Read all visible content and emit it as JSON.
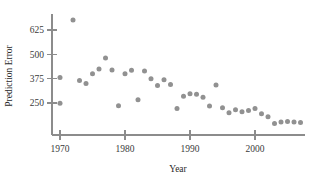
{
  "chart_data": {
    "type": "scatter",
    "title": "",
    "xlabel": "Year",
    "ylabel": "Prediction Error",
    "xlim": [
      1968.5,
      2008.5
    ],
    "ylim": [
      105,
      700
    ],
    "grid": false,
    "legend": null,
    "xticks": [
      1970,
      1980,
      1990,
      2000
    ],
    "xtick_labels": [
      "1970",
      "1980",
      "1990",
      "2000"
    ],
    "yticks": [
      250,
      375,
      500,
      625
    ],
    "ytick_labels": [
      "250",
      "375",
      "500",
      "625"
    ],
    "marker_color": "#919191",
    "axis_color": "#8c8c8c",
    "text_color": "#2b2b2b",
    "x": [
      1970,
      1970,
      1972,
      1973,
      1974,
      1975,
      1976,
      1977,
      1978,
      1979,
      1980,
      1981,
      1982,
      1983,
      1984,
      1985,
      1986,
      1987,
      1988,
      1989,
      1990,
      1991,
      1992,
      1993,
      1994,
      1995,
      1996,
      1997,
      1998,
      1999,
      2000,
      2001,
      2002,
      2003,
      2004,
      2005,
      2006,
      2007
    ],
    "y": [
      381,
      249,
      676,
      366,
      350,
      400,
      425,
      481,
      420,
      236,
      400,
      418,
      267,
      415,
      375,
      340,
      370,
      345,
      222,
      285,
      298,
      295,
      280,
      235,
      343,
      225,
      200,
      215,
      205,
      212,
      222,
      195,
      180,
      145,
      152,
      155,
      152,
      150
    ],
    "points": [
      {
        "year": 1970,
        "error": 381
      },
      {
        "year": 1970,
        "error": 249
      },
      {
        "year": 1972,
        "error": 676
      },
      {
        "year": 1973,
        "error": 366
      },
      {
        "year": 1974,
        "error": 350
      },
      {
        "year": 1975,
        "error": 400
      },
      {
        "year": 1976,
        "error": 425
      },
      {
        "year": 1977,
        "error": 481
      },
      {
        "year": 1978,
        "error": 420
      },
      {
        "year": 1979,
        "error": 236
      },
      {
        "year": 1980,
        "error": 400
      },
      {
        "year": 1981,
        "error": 418
      },
      {
        "year": 1982,
        "error": 267
      },
      {
        "year": 1983,
        "error": 415
      },
      {
        "year": 1984,
        "error": 375
      },
      {
        "year": 1985,
        "error": 340
      },
      {
        "year": 1986,
        "error": 370
      },
      {
        "year": 1987,
        "error": 345
      },
      {
        "year": 1988,
        "error": 222
      },
      {
        "year": 1989,
        "error": 285
      },
      {
        "year": 1990,
        "error": 298
      },
      {
        "year": 1991,
        "error": 295
      },
      {
        "year": 1992,
        "error": 280
      },
      {
        "year": 1993,
        "error": 235
      },
      {
        "year": 1994,
        "error": 343
      },
      {
        "year": 1995,
        "error": 225
      },
      {
        "year": 1996,
        "error": 200
      },
      {
        "year": 1997,
        "error": 215
      },
      {
        "year": 1998,
        "error": 205
      },
      {
        "year": 1999,
        "error": 212
      },
      {
        "year": 2000,
        "error": 222
      },
      {
        "year": 2001,
        "error": 195
      },
      {
        "year": 2002,
        "error": 180
      },
      {
        "year": 2003,
        "error": 145
      },
      {
        "year": 2004,
        "error": 152
      },
      {
        "year": 2005,
        "error": 155
      },
      {
        "year": 2006,
        "error": 152
      },
      {
        "year": 2007,
        "error": 150
      }
    ]
  }
}
